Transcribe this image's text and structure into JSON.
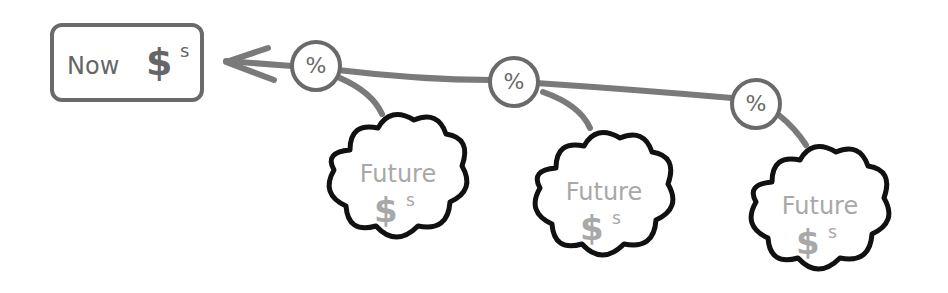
{
  "diagram": {
    "now_box": {
      "label": "Now",
      "currency": "$",
      "superscript": "s"
    },
    "discount_nodes": [
      {
        "symbol": "%"
      },
      {
        "symbol": "%"
      },
      {
        "symbol": "%"
      }
    ],
    "future_clouds": [
      {
        "label": "Future",
        "currency": "$",
        "superscript": "s"
      },
      {
        "label": "Future",
        "currency": "$",
        "superscript": "s"
      },
      {
        "label": "Future",
        "currency": "$",
        "superscript": "s"
      }
    ],
    "colors": {
      "arrow": "#777777",
      "cloud_outline": "#111111",
      "cloud_text": "#a8a8a8",
      "box": "#6a6a6a"
    }
  }
}
